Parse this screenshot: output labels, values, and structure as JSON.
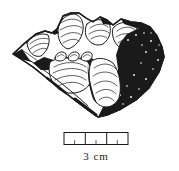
{
  "figure": {
    "caption": "3 cm",
    "scale_bar": {
      "segments": 3,
      "label": "3 cm"
    },
    "colors": {
      "ink": "#1a1a1a",
      "paper": "#ffffff"
    }
  }
}
